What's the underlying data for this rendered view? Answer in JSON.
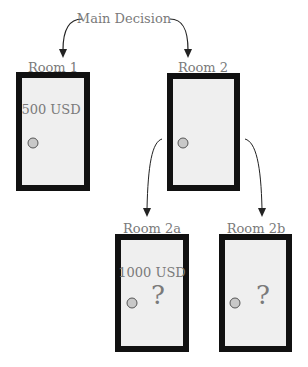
{
  "title": "Main Decision",
  "colors": {
    "door_border": "#111111",
    "door_fill": "#efefef",
    "text": "#7a7a7a",
    "knob": "#c8c8c8",
    "arrow": "#222222"
  },
  "rooms": [
    {
      "id": "room1",
      "label": "Room 1",
      "amount": "500 USD",
      "unknown": ""
    },
    {
      "id": "room2",
      "label": "Room 2",
      "amount": "",
      "unknown": ""
    },
    {
      "id": "room2a",
      "label": "Room 2a",
      "amount": "1000 USD",
      "unknown": "?"
    },
    {
      "id": "room2b",
      "label": "Room 2b",
      "amount": "",
      "unknown": "?"
    }
  ],
  "edges": [
    {
      "from": "Main Decision",
      "to": "Room 1"
    },
    {
      "from": "Main Decision",
      "to": "Room 2"
    },
    {
      "from": "Room 2",
      "to": "Room 2a"
    },
    {
      "from": "Room 2",
      "to": "Room 2b"
    }
  ]
}
